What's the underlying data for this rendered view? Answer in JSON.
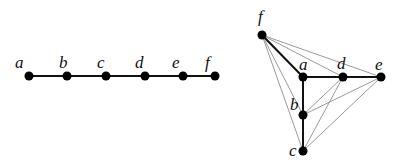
{
  "left_graph": {
    "description": "path graph",
    "nodes": [
      {
        "id": "a",
        "label": "a",
        "x": 29,
        "y": 76,
        "lx": 15,
        "ly": 68
      },
      {
        "id": "b",
        "label": "b",
        "x": 67,
        "y": 76,
        "lx": 59,
        "ly": 68
      },
      {
        "id": "c",
        "label": "c",
        "x": 106,
        "y": 76,
        "lx": 97,
        "ly": 68
      },
      {
        "id": "d",
        "label": "d",
        "x": 145,
        "y": 76,
        "lx": 135,
        "ly": 68
      },
      {
        "id": "e",
        "label": "e",
        "x": 183,
        "y": 76,
        "lx": 172,
        "ly": 68
      },
      {
        "id": "f",
        "label": "f",
        "x": 215,
        "y": 76,
        "lx": 205,
        "ly": 68
      }
    ],
    "edges": [
      [
        "a",
        "b"
      ],
      [
        "b",
        "c"
      ],
      [
        "c",
        "d"
      ],
      [
        "d",
        "e"
      ],
      [
        "e",
        "f"
      ]
    ]
  },
  "right_graph": {
    "description": "tree (bold) with added gray edges",
    "nodes": [
      {
        "id": "f",
        "label": "f",
        "x": 262,
        "y": 35,
        "lx": 258,
        "ly": 22
      },
      {
        "id": "a",
        "label": "a",
        "x": 303,
        "y": 77,
        "lx": 299,
        "ly": 70
      },
      {
        "id": "d",
        "label": "d",
        "x": 343,
        "y": 77,
        "lx": 337,
        "ly": 69
      },
      {
        "id": "e",
        "label": "e",
        "x": 381,
        "y": 77,
        "lx": 375,
        "ly": 70
      },
      {
        "id": "b",
        "label": "b",
        "x": 303,
        "y": 115,
        "lx": 290,
        "ly": 110
      },
      {
        "id": "c",
        "label": "c",
        "x": 303,
        "y": 151,
        "lx": 289,
        "ly": 156
      }
    ],
    "tree_edges": [
      [
        "f",
        "a"
      ],
      [
        "a",
        "d"
      ],
      [
        "d",
        "e"
      ],
      [
        "a",
        "b"
      ],
      [
        "b",
        "c"
      ]
    ],
    "gray_edges": [
      [
        "f",
        "d"
      ],
      [
        "f",
        "e"
      ],
      [
        "f",
        "b"
      ],
      [
        "f",
        "c"
      ],
      [
        "b",
        "d"
      ],
      [
        "b",
        "e"
      ],
      [
        "c",
        "d"
      ],
      [
        "c",
        "e"
      ]
    ]
  },
  "colors": {
    "tree_edge": "#111111",
    "gray_edge": "#9a9a9a",
    "node": "#000000"
  }
}
